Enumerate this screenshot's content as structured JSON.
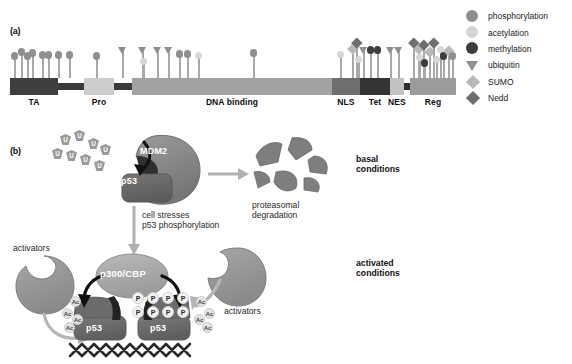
{
  "figure": {
    "panel_a_label": "(a)",
    "panel_b_label": "(b)"
  },
  "panel_a": {
    "domains": [
      {
        "name": "TA",
        "x": 10,
        "width": 48,
        "color": "#3f3f3f",
        "label_x": 10,
        "label_w": 48
      },
      {
        "name": "linker1",
        "x": 58,
        "width": 26,
        "color": "#3a3a3a",
        "thin": true
      },
      {
        "name": "Pro",
        "x": 84,
        "width": 30,
        "color": "#cdcdcd",
        "label_x": 84,
        "label_w": 30
      },
      {
        "name": "linker2",
        "x": 114,
        "width": 18,
        "color": "#3a3a3a",
        "thin": true
      },
      {
        "name": "DNA binding",
        "x": 132,
        "width": 200,
        "color": "#a3a3a3",
        "label_x": 132,
        "label_w": 200
      },
      {
        "name": "NLS",
        "x": 332,
        "width": 28,
        "color": "#6f6f6f",
        "label_x": 332,
        "label_w": 28
      },
      {
        "name": "Tet",
        "x": 360,
        "width": 30,
        "color": "#333333",
        "label_x": 360,
        "label_w": 30
      },
      {
        "name": "NES",
        "x": 390,
        "width": 14,
        "color": "#c2c2c2",
        "label_x": 388,
        "label_w": 18
      },
      {
        "name": "linker3",
        "x": 404,
        "width": 6,
        "color": "#2e2e2e",
        "thin": true
      },
      {
        "name": "Reg",
        "x": 410,
        "width": 46,
        "color": "#9b9b9b",
        "label_x": 410,
        "label_w": 46
      }
    ],
    "marks": [
      {
        "x": 14,
        "h": 24,
        "type": "phosphorylation"
      },
      {
        "x": 21,
        "h": 28,
        "type": "phosphorylation"
      },
      {
        "x": 27,
        "h": 24,
        "type": "phosphorylation"
      },
      {
        "x": 32,
        "h": 27,
        "type": "phosphorylation"
      },
      {
        "x": 42,
        "h": 25,
        "type": "phosphorylation"
      },
      {
        "x": 48,
        "h": 25,
        "type": "phosphorylation"
      },
      {
        "x": 58,
        "h": 25,
        "type": "phosphorylation"
      },
      {
        "x": 69,
        "h": 25,
        "type": "phosphorylation"
      },
      {
        "x": 96,
        "h": 24,
        "type": "phosphorylation"
      },
      {
        "x": 122,
        "h": 30,
        "type": "ubiquitin"
      },
      {
        "x": 142,
        "h": 30,
        "type": "ubiquitin"
      },
      {
        "x": 143,
        "h": 18,
        "type": "acetylation"
      },
      {
        "x": 157,
        "h": 30,
        "type": "ubiquitin"
      },
      {
        "x": 168,
        "h": 30,
        "type": "ubiquitin"
      },
      {
        "x": 179,
        "h": 26,
        "type": "phosphorylation"
      },
      {
        "x": 187,
        "h": 26,
        "type": "phosphorylation"
      },
      {
        "x": 198,
        "h": 24,
        "type": "acetylation"
      },
      {
        "x": 253,
        "h": 27,
        "type": "phosphorylation"
      },
      {
        "x": 340,
        "h": 25,
        "type": "acetylation"
      },
      {
        "x": 352,
        "h": 30,
        "type": "sumo"
      },
      {
        "x": 356,
        "h": 36,
        "type": "nedd"
      },
      {
        "x": 358,
        "h": 20,
        "type": "acetylation"
      },
      {
        "x": 363,
        "h": 30,
        "type": "ubiquitin"
      },
      {
        "x": 370,
        "h": 30,
        "type": "methylation"
      },
      {
        "x": 377,
        "h": 30,
        "type": "methylation"
      },
      {
        "x": 390,
        "h": 30,
        "type": "ubiquitin"
      },
      {
        "x": 398,
        "h": 30,
        "type": "ubiquitin"
      },
      {
        "x": 413,
        "h": 36,
        "type": "nedd"
      },
      {
        "x": 418,
        "h": 30,
        "type": "sumo"
      },
      {
        "x": 419,
        "h": 22,
        "type": "acetylation"
      },
      {
        "x": 423,
        "h": 34,
        "type": "nedd"
      },
      {
        "x": 424,
        "h": 17,
        "type": "methylation"
      },
      {
        "x": 429,
        "h": 27,
        "type": "sumo"
      },
      {
        "x": 433,
        "h": 36,
        "type": "nedd"
      },
      {
        "x": 436,
        "h": 20,
        "type": "acetylation"
      },
      {
        "x": 440,
        "h": 30,
        "type": "acetylation"
      },
      {
        "x": 443,
        "h": 24,
        "type": "methylation"
      },
      {
        "x": 448,
        "h": 28,
        "type": "sumo"
      },
      {
        "x": 452,
        "h": 24,
        "type": "phosphorylation"
      }
    ]
  },
  "legend": {
    "items": [
      {
        "label": "phosphorylation",
        "shape": "circle",
        "color": "#8f8f8f",
        "icon": "phosphorylation-icon"
      },
      {
        "label": "acetylation",
        "shape": "circle",
        "color": "#d6d6d6",
        "icon": "acetylation-icon"
      },
      {
        "label": "methylation",
        "shape": "circle",
        "color": "#3c3c3c",
        "icon": "methylation-icon"
      },
      {
        "label": "ubiquitin",
        "shape": "triangle",
        "color": "#8f8f8f",
        "icon": "ubiquitin-icon"
      },
      {
        "label": "SUMO",
        "shape": "diamond",
        "color": "#b8b8b8",
        "icon": "sumo-icon"
      },
      {
        "label": "Nedd",
        "shape": "diamond",
        "color": "#6e6e6e",
        "icon": "nedd-icon"
      }
    ]
  },
  "panel_b": {
    "mdm2_label": "MDM2",
    "p53_label": "p53",
    "ubiquitin_letter": "U",
    "ubiquitin_count": 8,
    "degradation_caption": "proteasomal\ndegradation",
    "degradation_caption_line1": "proteasomal",
    "degradation_caption_line2": "degradation",
    "basal_line1": "basal",
    "basal_line2": "conditions",
    "stress_line1": "cell stresses",
    "stress_line2": "p53 phosphorylation",
    "activated_line1": "activated",
    "activated_line2": "conditions",
    "coactivator_label": "p300/CBP",
    "p53_left_label": "p53",
    "p53_right_label": "p53",
    "activators_left": "activators",
    "activators_right": "activators",
    "phospho_badge": "P",
    "acetyl_badge": "Ac",
    "phospho_badge_count": 8,
    "acetyl_badge_count": 8
  },
  "colors": {
    "phosphorylation": "#8f8f8f",
    "acetylation": "#d6d6d6",
    "methylation": "#3c3c3c",
    "ubiquitin": "#8f8f8f",
    "sumo": "#b8b8b8",
    "nedd": "#6e6e6e",
    "stem": "#a9a9a9",
    "blob_dark": "#5d5d5d",
    "blob_mid": "#8a8a8a",
    "blob_light": "#b5b5b5",
    "arrow_dark": "#141414",
    "arrow_grey": "#b0b0b0",
    "text": "#111111"
  }
}
